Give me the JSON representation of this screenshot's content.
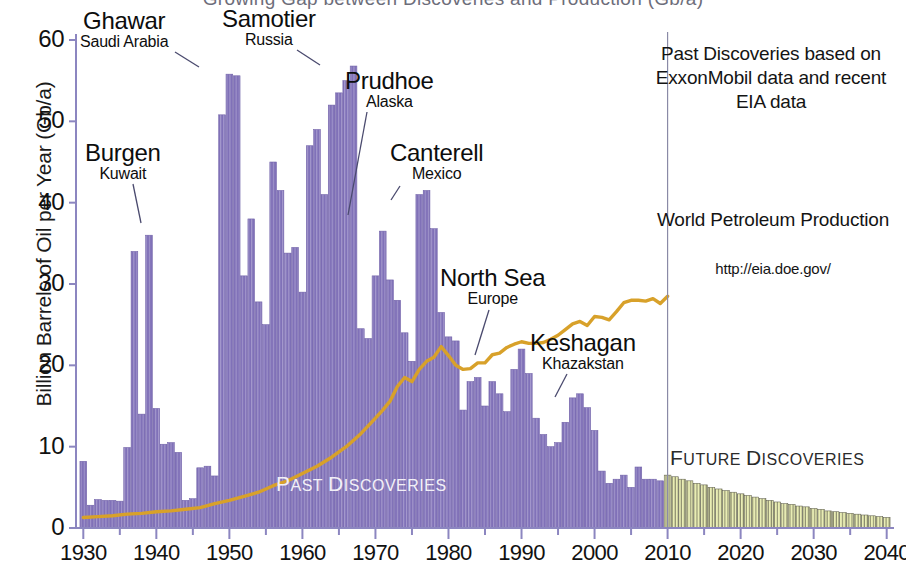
{
  "figure": {
    "title_partial": "Growing Gap between Discoveries and Production (Gb/a)",
    "divider_year": 2010
  },
  "axes": {
    "y_label": "Billion Barrels of Oil per Year (Gb/a)",
    "y_ticks": [
      "0",
      "10",
      "20",
      "30",
      "40",
      "50",
      "60"
    ],
    "y_tick_values": [
      0,
      10,
      20,
      30,
      40,
      50,
      60
    ],
    "y_min": 0,
    "y_max": 60,
    "x_ticks": [
      "1930",
      "1940",
      "1950",
      "1960",
      "1970",
      "1980",
      "1990",
      "2000",
      "2010",
      "2020",
      "2030",
      "2040"
    ],
    "x_tick_values": [
      1930,
      1940,
      1950,
      1960,
      1970,
      1980,
      1990,
      2000,
      2010,
      2020,
      2030,
      2040
    ],
    "x_min": 1929,
    "x_max": 2041,
    "minor_tick_step": 5
  },
  "annotations": [
    {
      "name": "ghawar",
      "field": "Ghawar",
      "country": "Saudi Arabia",
      "x": 80,
      "y": 8,
      "align": "center",
      "leader": {
        "x1": 175,
        "y1": 52,
        "x2": 199,
        "y2": 67
      }
    },
    {
      "name": "samotier",
      "field": "Samotier",
      "country": "Russia",
      "x": 222,
      "y": 6,
      "align": "center",
      "leader": {
        "x1": 297,
        "y1": 50,
        "x2": 320,
        "y2": 65
      }
    },
    {
      "name": "prudhoe",
      "field": "Prudhoe",
      "country": "Alaska",
      "x": 345,
      "y": 68,
      "align": "center",
      "leader": {
        "x1": 367,
        "y1": 112,
        "x2": 348,
        "y2": 215
      }
    },
    {
      "name": "canterell",
      "field": "Canterell",
      "country": "Mexico",
      "x": 390,
      "y": 140,
      "align": "center",
      "leader": {
        "x1": 400,
        "y1": 186,
        "x2": 391,
        "y2": 200
      }
    },
    {
      "name": "north-sea",
      "field": "North Sea",
      "country": "Europe",
      "x": 440,
      "y": 265,
      "align": "center",
      "leader": {
        "x1": 489,
        "y1": 310,
        "x2": 475,
        "y2": 355
      }
    },
    {
      "name": "keshagan",
      "field": "Keshagan",
      "country": "Khazakstan",
      "x": 530,
      "y": 330,
      "align": "center",
      "leader": {
        "x1": 567,
        "y1": 374,
        "x2": 555,
        "y2": 397
      }
    },
    {
      "name": "burgen",
      "field": "Burgen",
      "country": "Kuwait",
      "x": 85,
      "y": 140,
      "align": "center",
      "leader": {
        "x1": 133,
        "y1": 184,
        "x2": 141,
        "y2": 223
      }
    }
  ],
  "side_panel": {
    "source_note": "Past Discoveries based on ExxonMobil data and recent EIA data",
    "production_title": "World Petroleum Production",
    "production_url": "http://eia.doe.gov/"
  },
  "series_labels": {
    "past": "Past Discoveries",
    "future": "Future Discoveries"
  },
  "colors": {
    "discovery_bar": "#8071b8",
    "discovery_bar_light": "#a99ed0",
    "future_bar": "#e9edb4",
    "future_bar_edge": "#6b6b55",
    "production_line": "#d8a12a",
    "axis": "#8c86c0",
    "text": "#111111",
    "past_label": "#f2f0f7",
    "future_label": "#2b2b2b"
  },
  "chart_data": {
    "type": "bar",
    "title": "Growing Gap between Discoveries and Production (Gb/a)",
    "xlabel": "",
    "ylabel": "Billion Barrels of Oil per Year (Gb/a)",
    "xlim": [
      1929,
      2041
    ],
    "ylim": [
      0,
      60
    ],
    "grid": false,
    "legend": "none",
    "series": [
      {
        "name": "Past Discoveries",
        "type": "bar",
        "color": "#8071b8",
        "x": [
          1930,
          1931,
          1932,
          1933,
          1934,
          1935,
          1936,
          1937,
          1938,
          1939,
          1940,
          1941,
          1942,
          1943,
          1944,
          1945,
          1946,
          1947,
          1948,
          1949,
          1950,
          1951,
          1952,
          1953,
          1954,
          1955,
          1956,
          1957,
          1958,
          1959,
          1960,
          1961,
          1962,
          1963,
          1964,
          1965,
          1966,
          1967,
          1968,
          1969,
          1970,
          1971,
          1972,
          1973,
          1974,
          1975,
          1976,
          1977,
          1978,
          1979,
          1980,
          1981,
          1982,
          1983,
          1984,
          1985,
          1986,
          1987,
          1988,
          1989,
          1990,
          1991,
          1992,
          1993,
          1994,
          1995,
          1996,
          1997,
          1998,
          1999,
          2000,
          2001,
          2002,
          2003,
          2004,
          2005,
          2006,
          2007,
          2008,
          2009
        ],
        "values": [
          8.2,
          2.8,
          3.5,
          3.4,
          3.4,
          3.3,
          9.9,
          34.0,
          14.0,
          36.0,
          14.7,
          10.3,
          10.5,
          9.3,
          3.4,
          3.6,
          7.4,
          7.6,
          6.4,
          50.8,
          55.8,
          55.6,
          31.0,
          38.0,
          27.8,
          25.0,
          45.0,
          41.5,
          33.8,
          34.5,
          29.0,
          47.0,
          49.0,
          41.0,
          52.0,
          53.5,
          55.0,
          56.8,
          24.5,
          23.3,
          31.0,
          36.5,
          30.5,
          28.0,
          24.0,
          20.5,
          41.0,
          41.5,
          36.8,
          26.5,
          23.5,
          23.0,
          14.5,
          18.0,
          18.5,
          15.0,
          18.0,
          16.5,
          14.3,
          19.5,
          22.0,
          19.0,
          13.5,
          11.5,
          10.0,
          10.5,
          13.0,
          16.0,
          16.5,
          14.8,
          12.0,
          7.0,
          5.5,
          6.0,
          6.5,
          5.0,
          7.5,
          6.0,
          6.0,
          5.8
        ]
      },
      {
        "name": "Future Discoveries",
        "type": "bar",
        "color": "#e9edb4",
        "x": [
          2010,
          2011,
          2012,
          2013,
          2014,
          2015,
          2016,
          2017,
          2018,
          2019,
          2020,
          2021,
          2022,
          2023,
          2024,
          2025,
          2026,
          2027,
          2028,
          2029,
          2030,
          2031,
          2032,
          2033,
          2034,
          2035,
          2036,
          2037,
          2038,
          2039,
          2040
        ],
        "values": [
          6.5,
          6.3,
          6.0,
          5.8,
          5.5,
          5.3,
          5.0,
          4.8,
          4.6,
          4.4,
          4.2,
          4.0,
          3.8,
          3.6,
          3.4,
          3.2,
          3.0,
          2.9,
          2.7,
          2.6,
          2.4,
          2.3,
          2.1,
          2.0,
          1.9,
          1.8,
          1.7,
          1.6,
          1.5,
          1.4,
          1.3
        ]
      },
      {
        "name": "World Petroleum Production",
        "type": "line",
        "color": "#d8a12a",
        "x": [
          1930,
          1932,
          1934,
          1936,
          1938,
          1940,
          1942,
          1944,
          1946,
          1948,
          1950,
          1952,
          1954,
          1956,
          1958,
          1960,
          1962,
          1964,
          1966,
          1968,
          1970,
          1971,
          1972,
          1973,
          1974,
          1975,
          1976,
          1977,
          1978,
          1979,
          1980,
          1981,
          1982,
          1983,
          1984,
          1985,
          1986,
          1987,
          1988,
          1989,
          1990,
          1991,
          1992,
          1993,
          1994,
          1995,
          1996,
          1997,
          1998,
          1999,
          2000,
          2001,
          2002,
          2003,
          2004,
          2005,
          2006,
          2007,
          2008,
          2009,
          2010
        ],
        "values": [
          1.3,
          1.4,
          1.5,
          1.7,
          1.8,
          2.0,
          2.1,
          2.3,
          2.5,
          3.0,
          3.4,
          3.9,
          4.4,
          5.2,
          5.8,
          6.7,
          7.6,
          8.7,
          10.0,
          11.6,
          13.5,
          14.5,
          15.6,
          17.4,
          18.5,
          18.0,
          19.5,
          20.5,
          21.0,
          22.3,
          21.2,
          20.0,
          19.5,
          19.6,
          20.3,
          20.3,
          21.3,
          21.5,
          22.2,
          22.6,
          22.9,
          22.7,
          22.7,
          22.8,
          23.2,
          23.7,
          24.4,
          25.1,
          25.4,
          24.9,
          26.0,
          25.9,
          25.6,
          26.6,
          27.7,
          28.0,
          28.0,
          27.9,
          28.2,
          27.6,
          28.5
        ]
      }
    ]
  }
}
